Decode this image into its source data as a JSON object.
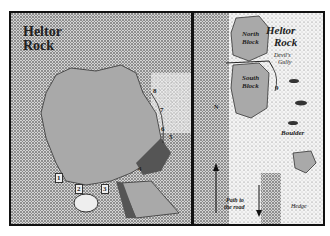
{
  "top_header": "",
  "left_panel": {
    "title_line1": "Heltor",
    "title_line2": "Rock",
    "route_numbers": [
      "1",
      "2",
      "3",
      "4",
      "5",
      "6",
      "7",
      "8"
    ]
  },
  "right_panel": {
    "title_line1": "Heltor",
    "title_line2": "Rock",
    "north_block": [
      "North",
      "Block"
    ],
    "south_block": [
      "South",
      "Block"
    ],
    "devils_gully": [
      "Devil's",
      "Gully"
    ],
    "route_number": "9",
    "boulder": "Boulder",
    "path_label": [
      "Path to",
      "the road"
    ],
    "hedge": "Hedge",
    "north_arrow": "N"
  },
  "colors": {
    "rock": "#a9a9a9",
    "shadow": "#555555",
    "stipple": "#333333",
    "border": "#111111"
  }
}
